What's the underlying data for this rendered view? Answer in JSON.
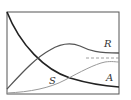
{
  "diagram": {
    "type": "curves",
    "labels": {
      "r": "R",
      "s": "S",
      "a": "A"
    },
    "colors": {
      "frame": "#555555",
      "decay": "#222222",
      "r_curve": "#555555",
      "a_curve": "#999999",
      "dashed": "#888888"
    }
  }
}
